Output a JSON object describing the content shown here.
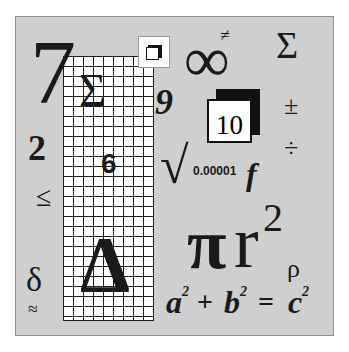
{
  "illustration": {
    "title": "Math symbols collage",
    "colors": {
      "panel_bg": "#cfcfcf",
      "ink": "#1a1a1a",
      "grid_bg": "#ffffff"
    },
    "symbols": {
      "seven": "7",
      "sigma_grid": "Σ",
      "nine": "9",
      "two": "2",
      "six": "6",
      "less_equal": "≤",
      "delta_small": "δ",
      "approx": "≈",
      "delta_big": "Δ",
      "not_equal": "≠",
      "infinity": "∞",
      "sigma_right": "Σ",
      "plus_minus": "±",
      "divide": "÷",
      "ten": "10",
      "sqrt": "√",
      "tiny_number": "0.00001",
      "f": "f",
      "pi": "π",
      "r": "r",
      "r_exp": "2",
      "rho": "ρ"
    },
    "equation": {
      "a": "a",
      "a_exp": "2",
      "plus": "+",
      "b": "b",
      "b_exp": "2",
      "equals": "=",
      "c": "c",
      "c_exp": "2"
    }
  }
}
